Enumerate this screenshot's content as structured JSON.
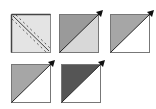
{
  "diagram": {
    "tiles": [
      {
        "id": "tile-1",
        "style": "double-dashed-diagonal",
        "fill_light": "#e4e4e4",
        "border_dark": "#444444",
        "has_arrow": false
      },
      {
        "id": "tile-2",
        "style": "split",
        "upper_fill": "#9a9a9a",
        "lower_fill": "#d8d8d8",
        "has_arrow": true
      },
      {
        "id": "tile-3",
        "style": "split",
        "upper_fill": "#a6a6a6",
        "lower_fill": "#ffffff",
        "has_arrow": true
      },
      {
        "id": "tile-4",
        "style": "split",
        "upper_fill": "#a6a6a6",
        "lower_fill": "#ffffff",
        "has_arrow": true
      },
      {
        "id": "tile-5",
        "style": "split",
        "upper_fill": "#555555",
        "lower_fill": "#ffffff",
        "has_arrow": true
      }
    ],
    "colors": {
      "border": "#888888",
      "line": "#222222",
      "arrow": "#111111"
    }
  }
}
